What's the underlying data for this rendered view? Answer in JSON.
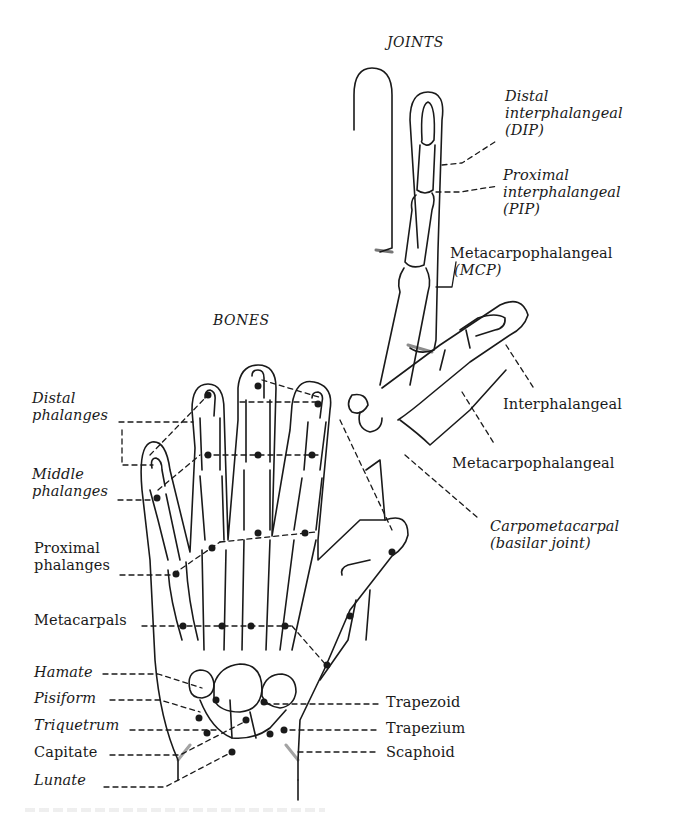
{
  "diagram": {
    "sections": {
      "joints_heading": "JOINTS",
      "bones_heading": "BONES"
    },
    "joint_labels": [
      {
        "id": "dip",
        "lines": [
          "Distal",
          "interphalangeal",
          "(DIP)"
        ]
      },
      {
        "id": "pip",
        "lines": [
          "Proximal",
          "interphalangeal",
          "(PIP)"
        ]
      },
      {
        "id": "mcp",
        "lines": [
          "Metacarpophalangeal",
          "(MCP)"
        ]
      },
      {
        "id": "thumb_ip",
        "lines": [
          "Interphalangeal"
        ]
      },
      {
        "id": "thumb_mcp",
        "lines": [
          "Metacarpophalangeal"
        ]
      },
      {
        "id": "cmc",
        "lines": [
          "Carpometacarpal",
          "(basilar joint)"
        ]
      }
    ],
    "bone_labels_left": [
      {
        "id": "distal_phalanges",
        "lines": [
          "Distal",
          "phalanges"
        ]
      },
      {
        "id": "middle_phalanges",
        "lines": [
          "Middle",
          "phalanges"
        ]
      },
      {
        "id": "proximal_phalanges",
        "lines": [
          "Proximal",
          "phalanges"
        ]
      },
      {
        "id": "metacarpals",
        "lines": [
          "Metacarpals"
        ]
      },
      {
        "id": "hamate",
        "lines": [
          "Hamate"
        ]
      },
      {
        "id": "pisiform",
        "lines": [
          "Pisiform"
        ]
      },
      {
        "id": "triquetrum",
        "lines": [
          "Triquetrum"
        ]
      },
      {
        "id": "capitate",
        "lines": [
          "Capitate"
        ]
      },
      {
        "id": "lunate",
        "lines": [
          "Lunate"
        ]
      }
    ],
    "bone_labels_right": [
      {
        "id": "trapezoid",
        "lines": [
          "Trapezoid"
        ]
      },
      {
        "id": "trapezium",
        "lines": [
          "Trapezium"
        ]
      },
      {
        "id": "scaphoid",
        "lines": [
          "Scaphoid"
        ]
      }
    ],
    "colors": {
      "ink": "#1a1a1a",
      "background": "#ffffff"
    }
  }
}
